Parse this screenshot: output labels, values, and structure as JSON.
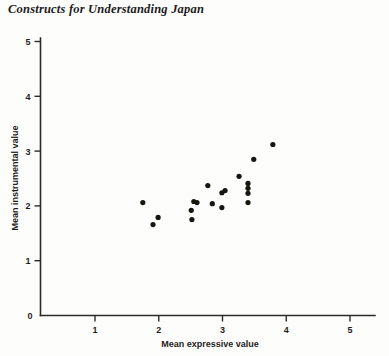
{
  "chart_data": {
    "type": "scatter",
    "title": "Constructs for Understanding Japan",
    "xlabel": "Mean expressive value",
    "ylabel": "Mean instrumental value",
    "xlim": [
      0,
      5.4
    ],
    "ylim": [
      0,
      5.2
    ],
    "xticks": [
      1,
      2,
      3,
      4,
      5
    ],
    "yticks": [
      1,
      2,
      3,
      4,
      5
    ],
    "xtick_labels": [
      "1",
      "2",
      "3",
      "4",
      "5"
    ],
    "ytick_labels": [
      "1",
      "2",
      "3",
      "4",
      "5"
    ],
    "origin_label": "0",
    "grid": false,
    "legend": null,
    "marker": "filled-circle",
    "marker_color": "#16160f",
    "points": [
      {
        "x": 1.75,
        "y": 2.06
      },
      {
        "x": 1.99,
        "y": 1.79
      },
      {
        "x": 1.91,
        "y": 1.66
      },
      {
        "x": 2.51,
        "y": 1.92
      },
      {
        "x": 2.52,
        "y": 1.75
      },
      {
        "x": 2.55,
        "y": 2.08
      },
      {
        "x": 2.6,
        "y": 2.06
      },
      {
        "x": 2.77,
        "y": 2.37
      },
      {
        "x": 2.84,
        "y": 2.04
      },
      {
        "x": 2.99,
        "y": 2.24
      },
      {
        "x": 2.99,
        "y": 1.97
      },
      {
        "x": 3.04,
        "y": 2.28
      },
      {
        "x": 3.26,
        "y": 2.54
      },
      {
        "x": 3.4,
        "y": 2.41
      },
      {
        "x": 3.4,
        "y": 2.32
      },
      {
        "x": 3.4,
        "y": 2.23
      },
      {
        "x": 3.4,
        "y": 2.06
      },
      {
        "x": 3.49,
        "y": 2.85
      },
      {
        "x": 3.79,
        "y": 3.12
      }
    ]
  },
  "figure": {
    "title": "Constructs for Understanding Japan"
  }
}
